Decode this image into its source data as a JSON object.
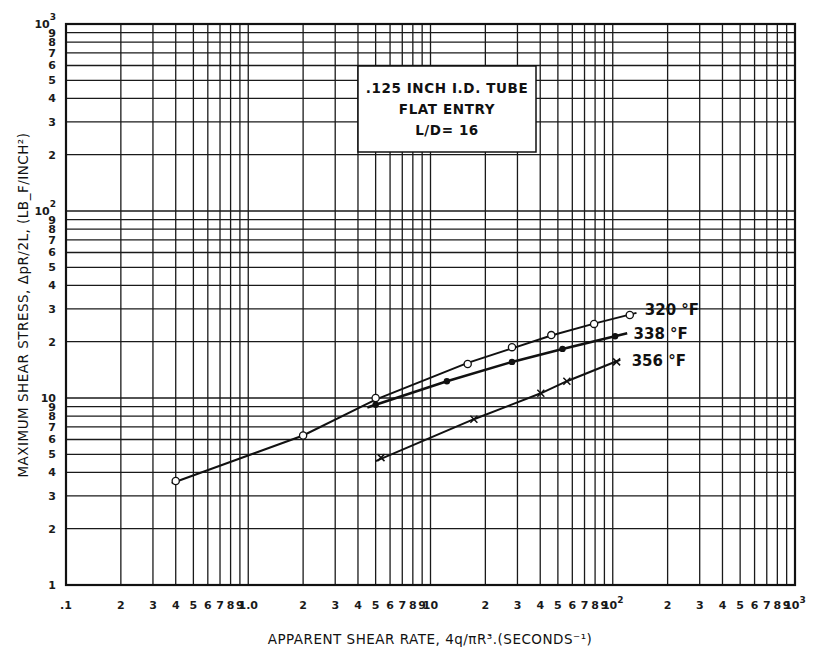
{
  "chart_data": {
    "type": "line",
    "scale": {
      "x": "log",
      "y": "log"
    },
    "title_box": {
      "lines": [
        ".125 INCH I.D. TUBE",
        "FLAT ENTRY",
        "L/D= 16"
      ]
    },
    "xlabel": "APPARENT SHEAR RATE, 4q/πR³.(SECONDS⁻¹)",
    "ylabel": "MAXIMUM SHEAR STRESS, ΔpR/2L, (LB_F/INCH²)",
    "xlim": [
      0.1,
      1000
    ],
    "ylim": [
      1,
      1000
    ],
    "grid": true,
    "x_tick_labels": [
      {
        "value": 0.1,
        "label": ".1"
      },
      {
        "value": 0.2,
        "label": "2"
      },
      {
        "value": 0.3,
        "label": "3"
      },
      {
        "value": 0.4,
        "label": "4"
      },
      {
        "value": 0.5,
        "label": "5"
      },
      {
        "value": 0.6,
        "label": "6"
      },
      {
        "value": 0.7,
        "label": "7"
      },
      {
        "value": 0.8,
        "label": "8"
      },
      {
        "value": 0.9,
        "label": "9"
      },
      {
        "value": 1,
        "label": "1.0"
      },
      {
        "value": 2,
        "label": "2"
      },
      {
        "value": 3,
        "label": "3"
      },
      {
        "value": 4,
        "label": "4"
      },
      {
        "value": 5,
        "label": "5"
      },
      {
        "value": 6,
        "label": "6"
      },
      {
        "value": 7,
        "label": "7"
      },
      {
        "value": 8,
        "label": "8"
      },
      {
        "value": 9,
        "label": "9"
      },
      {
        "value": 10,
        "label": "10"
      },
      {
        "value": 20,
        "label": "2"
      },
      {
        "value": 30,
        "label": "3"
      },
      {
        "value": 40,
        "label": "4"
      },
      {
        "value": 50,
        "label": "5"
      },
      {
        "value": 60,
        "label": "6"
      },
      {
        "value": 70,
        "label": "7"
      },
      {
        "value": 80,
        "label": "8"
      },
      {
        "value": 90,
        "label": "9"
      },
      {
        "value": 100,
        "label": "10",
        "sup": "2"
      },
      {
        "value": 200,
        "label": "2"
      },
      {
        "value": 300,
        "label": "3"
      },
      {
        "value": 400,
        "label": "4"
      },
      {
        "value": 500,
        "label": "5"
      },
      {
        "value": 600,
        "label": "6"
      },
      {
        "value": 700,
        "label": "7"
      },
      {
        "value": 800,
        "label": "8"
      },
      {
        "value": 900,
        "label": "9"
      },
      {
        "value": 1000,
        "label": "10",
        "sup": "3"
      }
    ],
    "y_tick_labels": [
      {
        "value": 1,
        "label": "1"
      },
      {
        "value": 2,
        "label": "2"
      },
      {
        "value": 3,
        "label": "3"
      },
      {
        "value": 4,
        "label": "4"
      },
      {
        "value": 5,
        "label": "5"
      },
      {
        "value": 6,
        "label": "6"
      },
      {
        "value": 7,
        "label": "7"
      },
      {
        "value": 8,
        "label": "8"
      },
      {
        "value": 9,
        "label": "9"
      },
      {
        "value": 10,
        "label": "10"
      },
      {
        "value": 20,
        "label": "2"
      },
      {
        "value": 30,
        "label": "3"
      },
      {
        "value": 40,
        "label": "4"
      },
      {
        "value": 50,
        "label": "5"
      },
      {
        "value": 60,
        "label": "6"
      },
      {
        "value": 70,
        "label": "7"
      },
      {
        "value": 80,
        "label": "8"
      },
      {
        "value": 90,
        "label": "9"
      },
      {
        "value": 100,
        "label": "10",
        "sup": "2"
      },
      {
        "value": 200,
        "label": "2"
      },
      {
        "value": 300,
        "label": "3"
      },
      {
        "value": 400,
        "label": "4"
      },
      {
        "value": 500,
        "label": "5"
      },
      {
        "value": 600,
        "label": "6"
      },
      {
        "value": 700,
        "label": "7"
      },
      {
        "value": 800,
        "label": "8"
      },
      {
        "value": 900,
        "label": "9"
      },
      {
        "value": 1000,
        "label": "10",
        "sup": "3"
      }
    ],
    "series": [
      {
        "name": "320 °F",
        "marker": "open-circle",
        "points": [
          [
            0.4,
            3.6
          ],
          [
            2.0,
            6.3
          ],
          [
            5.0,
            10.0
          ],
          [
            16,
            15.2
          ],
          [
            28,
            18.7
          ],
          [
            46,
            21.7
          ],
          [
            79,
            24.9
          ],
          [
            124,
            27.8
          ]
        ],
        "line": [
          [
            0.38,
            3.5
          ],
          [
            2.0,
            6.3
          ],
          [
            5.0,
            9.8
          ],
          [
            16,
            15.4
          ],
          [
            46,
            21.6
          ],
          [
            79,
            25.0
          ],
          [
            135,
            28.5
          ]
        ],
        "label_pos": [
          150,
          29.5
        ]
      },
      {
        "name": "338 °F",
        "marker": "filled-circle",
        "points": [
          [
            5.0,
            9.2
          ],
          [
            12.3,
            12.3
          ],
          [
            28,
            15.6
          ],
          [
            53,
            18.3
          ],
          [
            103,
            21.4
          ]
        ],
        "line": [
          [
            4.5,
            8.9
          ],
          [
            12.3,
            12.3
          ],
          [
            28,
            15.6
          ],
          [
            53,
            18.3
          ],
          [
            120,
            22.2
          ]
        ],
        "label_pos": [
          130,
          22.0
        ]
      },
      {
        "name": "356 °F",
        "marker": "x",
        "points": [
          [
            5.35,
            4.8
          ],
          [
            17.3,
            7.7
          ],
          [
            40.3,
            10.6
          ],
          [
            56,
            12.3
          ],
          [
            105,
            15.6
          ]
        ],
        "line": [
          [
            5.0,
            4.6
          ],
          [
            17.3,
            7.7
          ],
          [
            40.3,
            10.6
          ],
          [
            56,
            12.3
          ],
          [
            110,
            16.0
          ]
        ],
        "label_pos": [
          127,
          15.8
        ]
      }
    ]
  }
}
